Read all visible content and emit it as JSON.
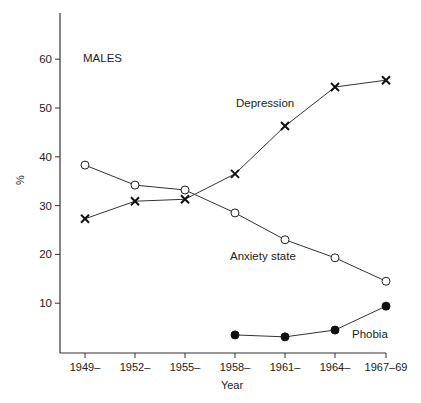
{
  "chart_data": {
    "type": "line",
    "title": "MALES",
    "xlabel": "Year",
    "ylabel": "%",
    "ylim": [
      0,
      70
    ],
    "yticks": [
      10,
      20,
      30,
      40,
      50,
      60
    ],
    "categories": [
      "1949–",
      "1952–",
      "1955–",
      "1958–",
      "1961–",
      "1964–",
      "1967–69"
    ],
    "grid": false,
    "legend_position": "inline labels",
    "series": [
      {
        "name": "Depression",
        "marker": "x",
        "values": [
          27.3,
          30.9,
          31.3,
          36.5,
          46.3,
          54.3,
          55.7
        ]
      },
      {
        "name": "Anxiety state",
        "marker": "open-circle",
        "values": [
          38.3,
          34.2,
          33.2,
          28.5,
          23.0,
          19.3,
          14.5
        ]
      },
      {
        "name": "Phobia",
        "marker": "filled-circle",
        "values": [
          null,
          null,
          null,
          3.5,
          3.1,
          4.5,
          9.4
        ]
      }
    ],
    "annotations": [
      {
        "text": "MALES",
        "x": "1949–",
        "y": 60
      },
      {
        "text": "Depression",
        "x": "1955–",
        "y": 49
      },
      {
        "text": "Anxiety state",
        "x": "1958–",
        "y": 17
      },
      {
        "text": "Phobia",
        "x": "1964–",
        "y": 3.5
      }
    ]
  }
}
